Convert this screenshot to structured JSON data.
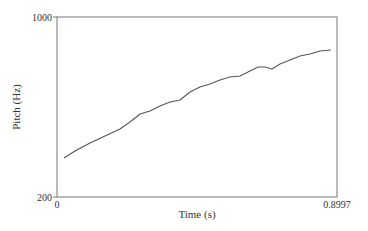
{
  "chart_data": {
    "type": "line",
    "title": "",
    "xlabel": "Time (s)",
    "ylabel": "Pitch (Hz)",
    "xlim": [
      0,
      0.8997
    ],
    "ylim": [
      200,
      1000
    ],
    "yscale": "log",
    "grid": false,
    "legend": null,
    "x_tick_labels": [
      "0",
      "0.8997"
    ],
    "y_tick_labels": [
      "200",
      "1000"
    ],
    "series": [
      {
        "name": "pitch",
        "color": "#555555",
        "x": [
          0.0225,
          0.0578,
          0.106,
          0.1542,
          0.2024,
          0.2346,
          0.2667,
          0.2988,
          0.331,
          0.3631,
          0.3952,
          0.4274,
          0.4595,
          0.4916,
          0.5238,
          0.5559,
          0.588,
          0.6202,
          0.6459,
          0.6684,
          0.6909,
          0.7166,
          0.7487,
          0.7809,
          0.813,
          0.8451,
          0.8805
        ],
        "y": [
          283,
          295,
          310,
          323,
          338,
          353,
          370,
          377,
          390,
          400,
          405,
          425,
          440,
          448,
          461,
          470,
          473,
          488,
          501,
          501,
          494,
          511,
          525,
          540,
          548,
          560,
          745
        ]
      }
    ]
  },
  "frame": {
    "left": 57,
    "top": 17,
    "right": 337,
    "bottom": 197
  },
  "pixel_path": [
    [
      64,
      158
    ],
    [
      75,
      151
    ],
    [
      90,
      143
    ],
    [
      105,
      136
    ],
    [
      120,
      129
    ],
    [
      130,
      122
    ],
    [
      140,
      114
    ],
    [
      150,
      111
    ],
    [
      160,
      106
    ],
    [
      170,
      102
    ],
    [
      180,
      100
    ],
    [
      190,
      92
    ],
    [
      200,
      87
    ],
    [
      210,
      84
    ],
    [
      220,
      80
    ],
    [
      230,
      77
    ],
    [
      240,
      76
    ],
    [
      250,
      71
    ],
    [
      258,
      67
    ],
    [
      265,
      67
    ],
    [
      272,
      69
    ],
    [
      280,
      64
    ],
    [
      290,
      60
    ],
    [
      300,
      56
    ],
    [
      310,
      54
    ],
    [
      320,
      51
    ],
    [
      331,
      50
    ]
  ]
}
